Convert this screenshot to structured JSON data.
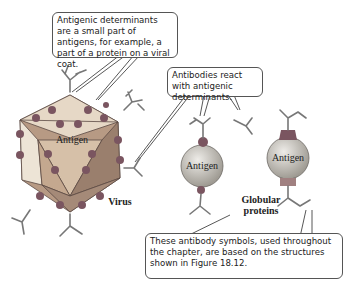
{
  "figure": {
    "callouts": {
      "top": "Antigenic determinants are a small part of antigens, for example, a part of a protein on a viral coat.",
      "middle": "Antibodies react with antigenic determinants.",
      "bottom": "These antibody symbols, used throughout the chapter, are based on the structures shown in Figure 18.12."
    },
    "labels": {
      "virus": "Virus",
      "globular": "Globular proteins",
      "antigen": "Antigen"
    },
    "colors": {
      "virus_face_light": "#e8d9c4",
      "virus_face_mid": "#c9a988",
      "virus_face_dark": "#9c7a63",
      "determinant_dot": "#7a5560",
      "sphere": "#c8c4bc",
      "antibody": "#7a7a7a",
      "antibody_light": "#b8aaa4"
    }
  }
}
